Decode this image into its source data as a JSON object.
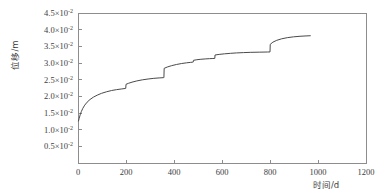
{
  "chart_data": {
    "type": "line",
    "title": "",
    "xlabel": "时间/d",
    "ylabel": "位移/m",
    "xlim": [
      0,
      1200
    ],
    "ylim": [
      0,
      0.045
    ],
    "grid": false,
    "legend": null,
    "y_tick_mantissas": [
      "0.5",
      "1.0",
      "1.5",
      "2.0",
      "2.5",
      "3.0",
      "3.5",
      "4.0",
      "4.5"
    ],
    "y_tick_exponent": "-2",
    "y_tick_multiplier": "×10",
    "y_tick_values": [
      0.005,
      0.01,
      0.015,
      0.02,
      0.025,
      0.03,
      0.035,
      0.04,
      0.045
    ],
    "x_tick_labels": [
      "0",
      "200",
      "400",
      "600",
      "800",
      "1000",
      "1200"
    ],
    "x_tick_values": [
      0,
      200,
      400,
      600,
      800,
      1000,
      1200
    ],
    "line_color": "#4a4a4a",
    "axis_color": "#8d8d8d",
    "background_color": "#ffffff",
    "series": [
      {
        "name": "位移",
        "x": [
          2,
          5,
          9,
          14,
          20,
          28,
          38,
          50,
          64,
          80,
          98,
          118,
          140,
          160,
          180,
          196,
          199,
          200,
          210,
          225,
          245,
          268,
          292,
          316,
          338,
          355,
          358,
          359,
          372,
          390,
          410,
          432,
          452,
          468,
          478,
          480,
          481,
          495,
          512,
          530,
          548,
          562,
          570,
          571,
          588,
          610,
          635,
          660,
          690,
          720,
          755,
          790,
          800,
          801,
          812,
          828,
          848,
          872,
          898,
          925,
          950,
          968
        ],
        "y": [
          0.0126,
          0.0134,
          0.01445,
          0.01545,
          0.0164,
          0.01735,
          0.01825,
          0.01905,
          0.01975,
          0.02035,
          0.0209,
          0.02135,
          0.02175,
          0.022,
          0.0222,
          0.02235,
          0.0224,
          0.0236,
          0.0239,
          0.02425,
          0.02462,
          0.02495,
          0.0252,
          0.0254,
          0.02552,
          0.0256,
          0.02562,
          0.0284,
          0.0288,
          0.0292,
          0.02955,
          0.02985,
          0.03005,
          0.03018,
          0.03025,
          0.03028,
          0.0308,
          0.03098,
          0.03112,
          0.03122,
          0.0313,
          0.03135,
          0.03138,
          0.0324,
          0.03258,
          0.03275,
          0.0329,
          0.03302,
          0.03312,
          0.0332,
          0.03325,
          0.0333,
          0.03332,
          0.0356,
          0.03625,
          0.0368,
          0.03725,
          0.0376,
          0.03785,
          0.03802,
          0.03812,
          0.03818
        ]
      }
    ],
    "step_jumps": [
      {
        "x": 200,
        "from": 0.0224,
        "to": 0.0236
      },
      {
        "x": 358,
        "from": 0.02562,
        "to": 0.0284
      },
      {
        "x": 480,
        "from": 0.03028,
        "to": 0.0308
      },
      {
        "x": 570,
        "from": 0.03138,
        "to": 0.0324
      },
      {
        "x": 800,
        "from": 0.03332,
        "to": 0.0356
      }
    ]
  }
}
